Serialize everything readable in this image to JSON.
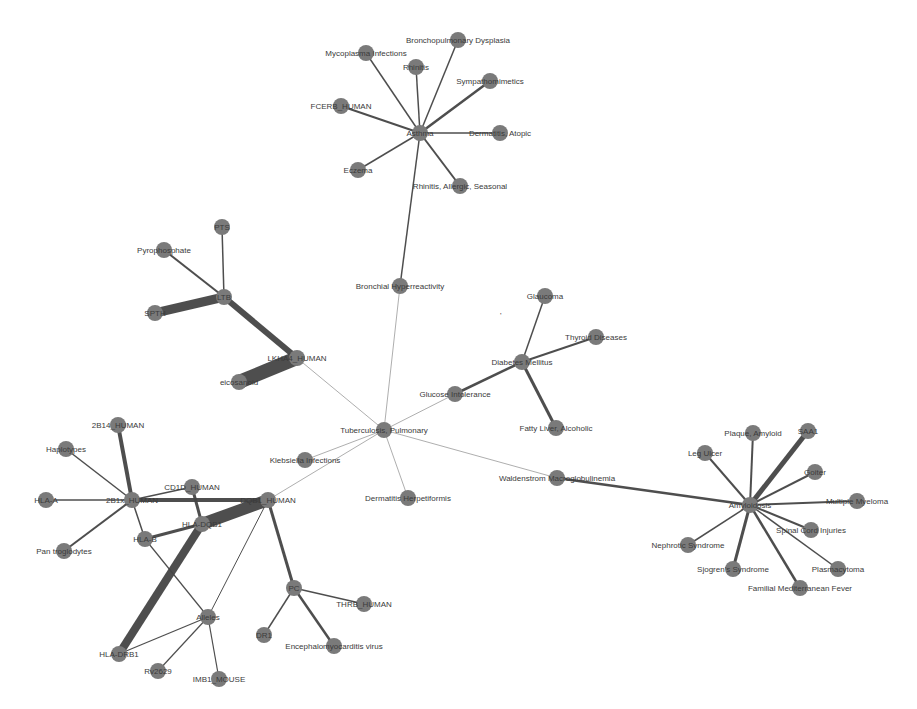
{
  "colors": {
    "node": "#7a7a7a",
    "edge": "#444444",
    "label": "#3a3a3a",
    "background": "#ffffff"
  },
  "nodes": [
    {
      "id": "asthma",
      "label": "Asthma",
      "x": 420,
      "y": 133
    },
    {
      "id": "mycoplasma",
      "label": "Mycoplasma Infections",
      "x": 366,
      "y": 53
    },
    {
      "id": "rhinitis",
      "label": "Rhinitis",
      "x": 416,
      "y": 67
    },
    {
      "id": "bpd",
      "label": "Bronchopulmonary Dysplasia",
      "x": 458,
      "y": 40
    },
    {
      "id": "sympath",
      "label": "Sympathomimetics",
      "x": 490,
      "y": 81
    },
    {
      "id": "fcerb",
      "label": "FCERB_HUMAN",
      "x": 341,
      "y": 106
    },
    {
      "id": "dermatitis_atopic",
      "label": "Dermatitis, Atopic",
      "x": 500,
      "y": 133
    },
    {
      "id": "eczema",
      "label": "Eczema",
      "x": 358,
      "y": 170
    },
    {
      "id": "rhinitis_allergic",
      "label": "Rhinitis, Allergic, Seasonal",
      "x": 460,
      "y": 186
    },
    {
      "id": "bronchial",
      "label": "Bronchial Hyperreactivity",
      "x": 400,
      "y": 286
    },
    {
      "id": "pts",
      "label": "PTS",
      "x": 222,
      "y": 227
    },
    {
      "id": "pyrophosphate",
      "label": "Pyrophosphate",
      "x": 164,
      "y": 250
    },
    {
      "id": "ltb",
      "label": "LTB",
      "x": 224,
      "y": 297
    },
    {
      "id": "spth",
      "label": "SPTH",
      "x": 155,
      "y": 313
    },
    {
      "id": "lkha4",
      "label": "LKHA4_HUMAN",
      "x": 297,
      "y": 358
    },
    {
      "id": "eicosanoid",
      "label": "eicosanoid",
      "x": 239,
      "y": 382
    },
    {
      "id": "glaucoma",
      "label": "Glaucoma",
      "x": 545,
      "y": 296
    },
    {
      "id": "thyroid",
      "label": "Thyroid Diseases",
      "x": 596,
      "y": 337
    },
    {
      "id": "diabetes",
      "label": "Diabetes Mellitus",
      "x": 522,
      "y": 362
    },
    {
      "id": "glucose",
      "label": "Glucose Intolerance",
      "x": 455,
      "y": 394
    },
    {
      "id": "fatty_liver",
      "label": "Fatty Liver, Alcoholic",
      "x": 556,
      "y": 428
    },
    {
      "id": "tb",
      "label": "Tuberculosis, Pulmonary",
      "x": 384,
      "y": 430
    },
    {
      "id": "klebsiella",
      "label": "Klebsiella Infections",
      "x": 305,
      "y": 460
    },
    {
      "id": "dermatitis_herp",
      "label": "Dermatitis Herpetiformis",
      "x": 408,
      "y": 498
    },
    {
      "id": "waldenstrom",
      "label": "Waldenstrom Macroglobulinemia",
      "x": 557,
      "y": 478
    },
    {
      "id": "amyloidosis",
      "label": "Amyloidosis",
      "x": 750,
      "y": 505
    },
    {
      "id": "plaque",
      "label": "Plaque, Amyloid",
      "x": 753,
      "y": 433
    },
    {
      "id": "saa1",
      "label": "SAA1",
      "x": 808,
      "y": 431
    },
    {
      "id": "leg_ulcer",
      "label": "Leg Ulcer",
      "x": 705,
      "y": 453
    },
    {
      "id": "goiter",
      "label": "Goiter",
      "x": 815,
      "y": 472
    },
    {
      "id": "myeloma",
      "label": "Multiple Myeloma",
      "x": 857,
      "y": 501
    },
    {
      "id": "spinal",
      "label": "Spinal Cord Injuries",
      "x": 811,
      "y": 530
    },
    {
      "id": "nephrotic",
      "label": "Nephrotic Syndrome",
      "x": 688,
      "y": 545
    },
    {
      "id": "sjogren",
      "label": "Sjogren's Syndrome",
      "x": 733,
      "y": 569
    },
    {
      "id": "plasmacytoma",
      "label": "Plasmacytoma",
      "x": 838,
      "y": 569
    },
    {
      "id": "fmf",
      "label": "Familial Mediterranean Fever",
      "x": 800,
      "y": 588
    },
    {
      "id": "2b14",
      "label": "2B14_HUMAN",
      "x": 118,
      "y": 425
    },
    {
      "id": "haplotypes",
      "label": "Haplotypes",
      "x": 66,
      "y": 449
    },
    {
      "id": "hla_a",
      "label": "HLA-A",
      "x": 46,
      "y": 500
    },
    {
      "id": "2b1x",
      "label": "2B1x_HUMAN",
      "x": 132,
      "y": 500
    },
    {
      "id": "cd1",
      "label": "CD1D_HUMAN",
      "x": 192,
      "y": 487
    },
    {
      "id": "pan",
      "label": "Pan troglodytes",
      "x": 64,
      "y": 551
    },
    {
      "id": "dqb1",
      "label": "DQB1_HUMAN",
      "x": 268,
      "y": 500
    },
    {
      "id": "hla_dqb1",
      "label": "HLA-DQB1",
      "x": 202,
      "y": 524
    },
    {
      "id": "hla_b",
      "label": "HLA-B",
      "x": 145,
      "y": 539
    },
    {
      "id": "alleles",
      "label": "Alleles",
      "x": 208,
      "y": 617
    },
    {
      "id": "hla_drb1",
      "label": "HLA-DRB1",
      "x": 119,
      "y": 654
    },
    {
      "id": "pc",
      "label": "PC",
      "x": 294,
      "y": 588
    },
    {
      "id": "thrb",
      "label": "THRB_HUMAN",
      "x": 364,
      "y": 604
    },
    {
      "id": "dr1",
      "label": "DR1",
      "x": 264,
      "y": 635
    },
    {
      "id": "emcv",
      "label": "Encephalomyocarditis virus",
      "x": 334,
      "y": 646
    },
    {
      "id": "rv2629",
      "label": "Rv2629",
      "x": 158,
      "y": 671
    },
    {
      "id": "imb1",
      "label": "IMB1_MOUSE",
      "x": 219,
      "y": 679
    }
  ],
  "edges": [
    {
      "s": "asthma",
      "t": "mycoplasma",
      "w": 1.5
    },
    {
      "s": "asthma",
      "t": "rhinitis",
      "w": 1.5
    },
    {
      "s": "asthma",
      "t": "bpd",
      "w": 1.5
    },
    {
      "s": "asthma",
      "t": "sympath",
      "w": 2.5
    },
    {
      "s": "asthma",
      "t": "fcerb",
      "w": 2
    },
    {
      "s": "asthma",
      "t": "dermatitis_atopic",
      "w": 1.5
    },
    {
      "s": "asthma",
      "t": "eczema",
      "w": 1.5
    },
    {
      "s": "asthma",
      "t": "rhinitis_allergic",
      "w": 2
    },
    {
      "s": "asthma",
      "t": "bronchial",
      "w": 1.5
    },
    {
      "s": "bronchial",
      "t": "tb",
      "w": 0.8
    },
    {
      "s": "ltb",
      "t": "pts",
      "w": 1.5
    },
    {
      "s": "ltb",
      "t": "pyrophosphate",
      "w": 2
    },
    {
      "s": "ltb",
      "t": "spth",
      "w": 9
    },
    {
      "s": "ltb",
      "t": "lkha4",
      "w": 6
    },
    {
      "s": "lkha4",
      "t": "eicosanoid",
      "w": 14
    },
    {
      "s": "lkha4",
      "t": "tb",
      "w": 0.8
    },
    {
      "s": "diabetes",
      "t": "glaucoma",
      "w": 1.5
    },
    {
      "s": "diabetes",
      "t": "thyroid",
      "w": 2
    },
    {
      "s": "diabetes",
      "t": "glucose",
      "w": 2.5
    },
    {
      "s": "diabetes",
      "t": "fatty_liver",
      "w": 3
    },
    {
      "s": "glucose",
      "t": "tb",
      "w": 0.8
    },
    {
      "s": "tb",
      "t": "klebsiella",
      "w": 0.8
    },
    {
      "s": "tb",
      "t": "dermatitis_herp",
      "w": 0.8
    },
    {
      "s": "tb",
      "t": "waldenstrom",
      "w": 0.8
    },
    {
      "s": "tb",
      "t": "dqb1",
      "w": 0.8
    },
    {
      "s": "waldenstrom",
      "t": "amyloidosis",
      "w": 2.5
    },
    {
      "s": "amyloidosis",
      "t": "plaque",
      "w": 2
    },
    {
      "s": "amyloidosis",
      "t": "saa1",
      "w": 5
    },
    {
      "s": "amyloidosis",
      "t": "leg_ulcer",
      "w": 2
    },
    {
      "s": "amyloidosis",
      "t": "goiter",
      "w": 2
    },
    {
      "s": "amyloidosis",
      "t": "myeloma",
      "w": 2
    },
    {
      "s": "amyloidosis",
      "t": "spinal",
      "w": 2
    },
    {
      "s": "amyloidosis",
      "t": "nephrotic",
      "w": 1.5
    },
    {
      "s": "amyloidosis",
      "t": "sjogren",
      "w": 3
    },
    {
      "s": "amyloidosis",
      "t": "plasmacytoma",
      "w": 1.5
    },
    {
      "s": "amyloidosis",
      "t": "fmf",
      "w": 2.5
    },
    {
      "s": "2b1x",
      "t": "2b14",
      "w": 4
    },
    {
      "s": "2b1x",
      "t": "haplotypes",
      "w": 1.5
    },
    {
      "s": "2b1x",
      "t": "hla_a",
      "w": 1.5
    },
    {
      "s": "2b1x",
      "t": "cd1",
      "w": 1.5
    },
    {
      "s": "2b1x",
      "t": "pan",
      "w": 2
    },
    {
      "s": "2b1x",
      "t": "dqb1",
      "w": 4
    },
    {
      "s": "2b1x",
      "t": "hla_b",
      "w": 1.5
    },
    {
      "s": "cd1",
      "t": "hla_dqb1",
      "w": 3
    },
    {
      "s": "dqb1",
      "t": "hla_dqb1",
      "w": 12
    },
    {
      "s": "dqb1",
      "t": "pc",
      "w": 3
    },
    {
      "s": "dqb1",
      "t": "alleles",
      "w": 1
    },
    {
      "s": "hla_dqb1",
      "t": "hla_b",
      "w": 3
    },
    {
      "s": "hla_dqb1",
      "t": "hla_drb1",
      "w": 8
    },
    {
      "s": "hla_b",
      "t": "alleles",
      "w": 1.2
    },
    {
      "s": "alleles",
      "t": "hla_drb1",
      "w": 1.2
    },
    {
      "s": "alleles",
      "t": "rv2629",
      "w": 1.2
    },
    {
      "s": "alleles",
      "t": "imb1",
      "w": 1.2
    },
    {
      "s": "pc",
      "t": "thrb",
      "w": 1.5
    },
    {
      "s": "pc",
      "t": "dr1",
      "w": 1.5
    },
    {
      "s": "pc",
      "t": "emcv",
      "w": 2.5
    }
  ],
  "annotations": [
    {
      "text": "'",
      "x": 500,
      "y": 318
    }
  ]
}
